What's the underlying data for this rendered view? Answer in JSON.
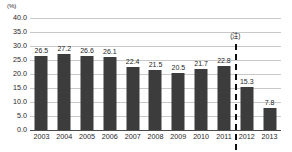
{
  "chart_data": {
    "type": "bar",
    "title": "",
    "subtitle": "",
    "xlabel": "(年)",
    "ylabel": "(%)",
    "categories": [
      "2003",
      "2004",
      "2005",
      "2006",
      "2007",
      "2008",
      "2009",
      "2010",
      "2011",
      "2012",
      "2013"
    ],
    "values": [
      26.5,
      27.2,
      26.6,
      26.1,
      22.4,
      21.5,
      20.5,
      21.7,
      22.8,
      15.3,
      7.8
    ],
    "value_labels": [
      "26.5",
      "27.2",
      "26.6",
      "26.1",
      "22.4",
      "21.5",
      "20.5",
      "21.7",
      "22.8",
      "15.3",
      "7.8"
    ],
    "ylim": [
      0,
      40
    ],
    "ytick_values": [
      40,
      35,
      30,
      25,
      20,
      15,
      10,
      5,
      0
    ],
    "ytick_labels": [
      "40.0",
      "35.0",
      "30.0",
      "25.0",
      "20.0",
      "15.0",
      "10.0",
      "5.0",
      "0.0"
    ],
    "grid": true,
    "legend": "none",
    "bar_color": "#3c3c3c",
    "gridline_color": "#c9c9c9",
    "axis_color": "#4a4a4a",
    "background_color": "#ffffff",
    "annotations": [
      {
        "name": "note-marker",
        "label": "(注)",
        "style": "dashed-vertical-line",
        "between": [
          "2011",
          "2012"
        ],
        "color": "#111111"
      }
    ]
  }
}
